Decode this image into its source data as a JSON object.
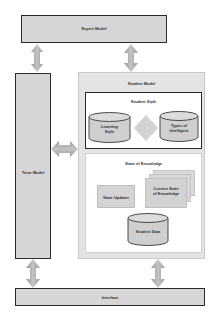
{
  "diagram": {
    "expert_model": {
      "label": "Expert Model"
    },
    "tutor_model": {
      "label": "Tutor Model"
    },
    "student_model": {
      "label": "Student Model",
      "student_style": {
        "label": "Student Style",
        "learning_style": {
          "line1": "Learning",
          "line2": "Style"
        },
        "types_of_intelligent": {
          "line1": "Types of",
          "line2": "Intelligent"
        }
      },
      "state_of_knowledge": {
        "label": "State of Knowledge",
        "state_updater": {
          "label": "State Updater"
        },
        "current_state": {
          "line1": "Current State",
          "line2": "of Knowledge"
        },
        "student_data": {
          "label": "Student Data"
        }
      }
    },
    "interface": {
      "label": "Interface"
    },
    "colors": {
      "box_fill": "#d6d6d6",
      "border_dark": "#2b2b2b",
      "student_model_fill": "#e6e6e6",
      "arrow": "#a9a9a9"
    }
  }
}
